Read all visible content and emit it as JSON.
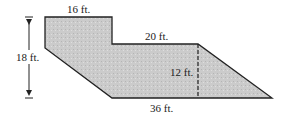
{
  "diagram": {
    "type": "composite-figure",
    "fill_color": "#c8c8c8",
    "stroke_color": "#222222",
    "labels": {
      "top_width": "16 ft.",
      "middle_width": "20 ft.",
      "height": "18 ft.",
      "trapezoid_height": "12 ft.",
      "bottom_width": "36 ft."
    }
  }
}
